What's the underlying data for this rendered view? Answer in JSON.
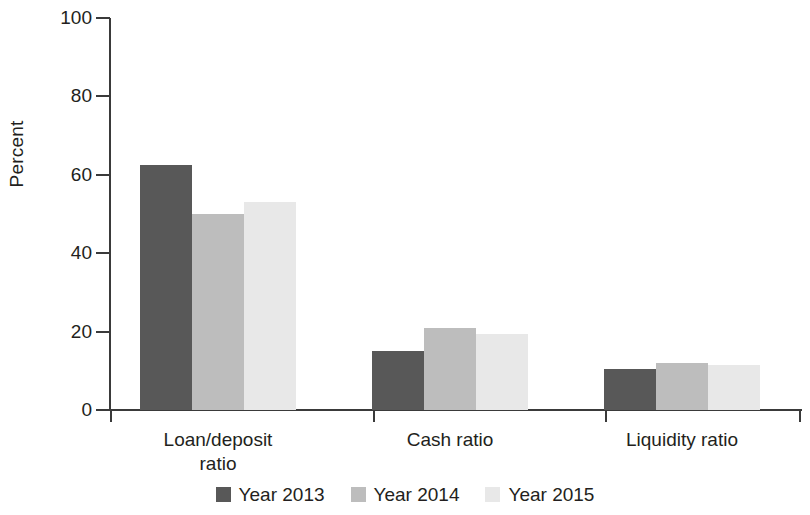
{
  "chart_data": {
    "type": "bar",
    "title": "",
    "subtitle": "",
    "xlabel": "",
    "ylabel": "Percent",
    "ylim": [
      0,
      100
    ],
    "yticks": [
      0,
      20,
      40,
      60,
      80,
      100
    ],
    "ytick_labels": [
      "0",
      "20",
      "40",
      "60",
      "80",
      "100"
    ],
    "grid": false,
    "legend_position": "bottom-center",
    "categories": [
      "Loan/deposit ratio",
      "Cash ratio",
      "Liquidity ratio"
    ],
    "category_label_lines": [
      [
        "Loan/deposit",
        "ratio"
      ],
      [
        "Cash ratio"
      ],
      [
        "Liquidity ratio"
      ]
    ],
    "series": [
      {
        "name": "Year 2013",
        "color": "#585858",
        "values": [
          62.5,
          15.0,
          10.5
        ]
      },
      {
        "name": "Year 2014",
        "color": "#bdbdbd",
        "values": [
          50.0,
          21.0,
          12.0
        ]
      },
      {
        "name": "Year 2015",
        "color": "#e8e8e8",
        "values": [
          53.0,
          19.5,
          11.5
        ]
      }
    ],
    "axis_color": "#3a3a3a",
    "text_color": "#231f20",
    "background": "#ffffff"
  },
  "legend": {
    "items": [
      {
        "label": "Year 2013",
        "color": "#585858"
      },
      {
        "label": "Year 2014",
        "color": "#bdbdbd"
      },
      {
        "label": "Year 2015",
        "color": "#e8e8e8"
      }
    ]
  }
}
